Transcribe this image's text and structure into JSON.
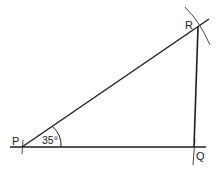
{
  "diagram": {
    "points": {
      "P": {
        "label": "P",
        "x": 22,
        "y": 147
      },
      "Q": {
        "label": "Q",
        "x": 194,
        "y": 147
      },
      "R": {
        "label": "R",
        "x": 198,
        "y": 27
      }
    },
    "angle": {
      "at": "P",
      "label": "35°"
    },
    "colors": {
      "line": "#1e1e1e",
      "background": "#ffffff"
    }
  }
}
